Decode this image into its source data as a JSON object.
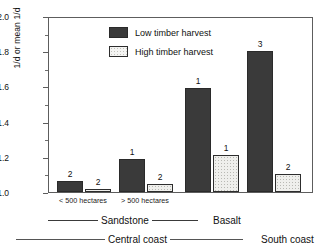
{
  "chart_data": {
    "type": "bar",
    "title": "",
    "xlabel": "",
    "ylabel": "1/d or mean 1/d",
    "ylim": [
      1.0,
      2.0
    ],
    "ytick_labels": [
      "1.0",
      "1.2",
      "1.4",
      "1.6",
      "1.8",
      "2.0"
    ],
    "ytick_values": [
      1.0,
      1.2,
      1.4,
      1.6,
      1.8,
      2.0
    ],
    "minor_tick_step": 0.1,
    "grid": false,
    "legend_position": "top-left-inside",
    "categories": [
      "< 500 hectares",
      "> 500 hectares",
      "Basalt",
      "South coast"
    ],
    "series": [
      {
        "name": "Low timber harvest",
        "color": "#3a3a3a",
        "values": [
          1.06,
          1.185,
          1.59,
          1.8
        ],
        "point_labels": [
          "2",
          "1",
          "1",
          "3"
        ]
      },
      {
        "name": "High timber harvest",
        "color": "#f2f2f0",
        "values": [
          1.015,
          1.045,
          1.21,
          1.1
        ],
        "point_labels": [
          "2",
          "2",
          "1",
          "2"
        ]
      }
    ],
    "group_axis_level1": [
      {
        "label": "Sandstone",
        "spans": [
          "< 500 hectares",
          "> 500 hectares"
        ],
        "rule": true
      },
      {
        "label": "Basalt",
        "spans": [
          "Basalt"
        ],
        "rule": false
      }
    ],
    "group_axis_level2": [
      {
        "label": "Central coast",
        "rule": true
      },
      {
        "label": "South coast",
        "rule": true
      }
    ]
  },
  "axis": {
    "y_label": "1/d or mean 1/d",
    "ticks": [
      {
        "label": "2.0"
      },
      {
        "label": "1.8"
      },
      {
        "label": "1.6"
      },
      {
        "label": "1.4"
      },
      {
        "label": "1.2"
      },
      {
        "label": "1.0"
      }
    ]
  },
  "legend": {
    "items": [
      {
        "label": "Low timber harvest",
        "swatch": "low-timber-swatch"
      },
      {
        "label": "High timber harvest",
        "swatch": "high-timber-swatch"
      }
    ]
  },
  "categories": [
    {
      "label": "< 500 hectares"
    },
    {
      "label": "> 500 hectares"
    }
  ],
  "hierarchy": {
    "level1": [
      {
        "label": "Sandstone"
      },
      {
        "label": "Basalt"
      }
    ],
    "level2": [
      {
        "label": "Central coast"
      },
      {
        "label": "South coast"
      }
    ]
  },
  "bars": [
    {
      "label": "2"
    },
    {
      "label": "2"
    },
    {
      "label": "1"
    },
    {
      "label": "2"
    },
    {
      "label": "1"
    },
    {
      "label": "1"
    },
    {
      "label": "3"
    },
    {
      "label": "2"
    }
  ]
}
